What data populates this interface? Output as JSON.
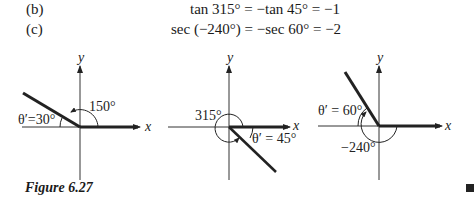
{
  "equations": [
    {
      "label": "(b)",
      "text": "tan 315° = −tan 45° = −1"
    },
    {
      "label": "(c)",
      "text": "sec (−240°) = −sec 60° = −2"
    }
  ],
  "figures": [
    {
      "angle_label": "150°",
      "ref_label": "θ′=30°",
      "x_axis": "x",
      "y_axis": "y"
    },
    {
      "angle_label": "315°",
      "ref_label": "θ′ = 45°",
      "x_axis": "x",
      "y_axis": "y"
    },
    {
      "angle_label": "−240°",
      "ref_label": "θ′ = 60°",
      "x_axis": "x",
      "y_axis": "y"
    }
  ],
  "caption": "Figure 6.27"
}
